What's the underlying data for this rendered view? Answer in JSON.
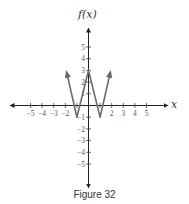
{
  "chart_data": {
    "type": "line",
    "title": "",
    "xlabel": "x",
    "ylabel": "f(x)",
    "xlim": [
      -6,
      6
    ],
    "ylim": [
      -6,
      6
    ],
    "grid": false,
    "x_ticks": [
      -5,
      -4,
      -3,
      -2,
      2,
      3,
      4,
      5
    ],
    "y_ticks": [
      5,
      4,
      3,
      2,
      1,
      -1,
      -2,
      -3,
      -4,
      -5
    ],
    "series": [
      {
        "name": "f(x)",
        "color": "#6b6b6b",
        "points": [
          [
            -1.85,
            2.7
          ],
          [
            -1,
            -1
          ],
          [
            0,
            3
          ],
          [
            1,
            -1
          ],
          [
            1.85,
            2.7
          ]
        ],
        "end_arrows": true
      }
    ],
    "key_points": {
      "maximum": [
        0,
        3
      ],
      "minima": [
        [
          -1,
          -1
        ],
        [
          1,
          -1
        ]
      ]
    }
  },
  "caption": "Figure 32"
}
